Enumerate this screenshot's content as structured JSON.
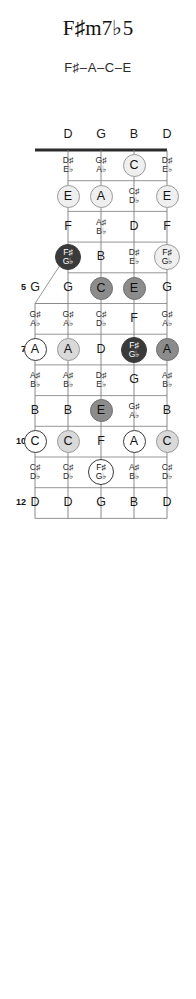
{
  "header": {
    "title": "F♯m7♭5",
    "subtitle": "F♯–A–C–E"
  },
  "instrument": {
    "name": "5-string banjo",
    "string_count": 5,
    "fret_count": 12,
    "open_strings": [
      "D",
      "G",
      "B",
      "D"
    ],
    "fifth_string_open": "G",
    "fifth_string_starts_at_fret": 5
  },
  "chord": {
    "name": "F♯m7♭5",
    "tones": [
      "F♯",
      "A",
      "C",
      "E"
    ],
    "root": "F♯"
  },
  "legend": {
    "root_fill": "#3a3a3a",
    "root_text": "#ffffff",
    "tone_fill_mid": "#8c8c8c",
    "tone_fill_light": "#d9d9d9",
    "tone_fill_pale": "#efefef",
    "tone_fill_open": "#ffffff",
    "line_color": "#8a8a8a",
    "nut_color": "#2b2b2b"
  },
  "fret_markers": [
    "5",
    "7",
    "10",
    "12"
  ],
  "open_row": {
    "fret": 0,
    "labels": [
      "D",
      "G",
      "B",
      "D"
    ]
  },
  "notes": [
    {
      "fret": 1,
      "string": 1,
      "text": "D♯\nE♭",
      "style": "plain"
    },
    {
      "fret": 1,
      "string": 2,
      "text": "G♯\nA♭",
      "style": "plain"
    },
    {
      "fret": 1,
      "string": 3,
      "text": "C",
      "style": "pale"
    },
    {
      "fret": 1,
      "string": 4,
      "text": "D♯\nE♭",
      "style": "plain"
    },
    {
      "fret": 2,
      "string": 1,
      "text": "E",
      "style": "pale"
    },
    {
      "fret": 2,
      "string": 2,
      "text": "A",
      "style": "pale"
    },
    {
      "fret": 2,
      "string": 3,
      "text": "C♯\nD♭",
      "style": "plain"
    },
    {
      "fret": 2,
      "string": 4,
      "text": "E",
      "style": "pale"
    },
    {
      "fret": 3,
      "string": 1,
      "text": "F",
      "style": "plain"
    },
    {
      "fret": 3,
      "string": 2,
      "text": "A♯\nB♭",
      "style": "plain"
    },
    {
      "fret": 3,
      "string": 3,
      "text": "D",
      "style": "plain"
    },
    {
      "fret": 3,
      "string": 4,
      "text": "F",
      "style": "plain"
    },
    {
      "fret": 4,
      "string": 1,
      "text": "F♯\nG♭",
      "style": "root"
    },
    {
      "fret": 4,
      "string": 2,
      "text": "B",
      "style": "plain"
    },
    {
      "fret": 4,
      "string": 3,
      "text": "D♯\nE♭",
      "style": "plain"
    },
    {
      "fret": 4,
      "string": 4,
      "text": "F♯\nG♭",
      "style": "pale"
    },
    {
      "fret": 5,
      "string": 0,
      "text": "G",
      "style": "plain"
    },
    {
      "fret": 5,
      "string": 1,
      "text": "G",
      "style": "plain"
    },
    {
      "fret": 5,
      "string": 2,
      "text": "C",
      "style": "mid"
    },
    {
      "fret": 5,
      "string": 3,
      "text": "E",
      "style": "mid"
    },
    {
      "fret": 5,
      "string": 4,
      "text": "G",
      "style": "plain"
    },
    {
      "fret": 6,
      "string": 0,
      "text": "G♯\nA♭",
      "style": "plain"
    },
    {
      "fret": 6,
      "string": 1,
      "text": "G♯\nA♭",
      "style": "plain"
    },
    {
      "fret": 6,
      "string": 2,
      "text": "C♯\nD♭",
      "style": "plain"
    },
    {
      "fret": 6,
      "string": 3,
      "text": "F",
      "style": "plain"
    },
    {
      "fret": 6,
      "string": 4,
      "text": "G♯\nA♭",
      "style": "plain"
    },
    {
      "fret": 7,
      "string": 0,
      "text": "A",
      "style": "open"
    },
    {
      "fret": 7,
      "string": 1,
      "text": "A",
      "style": "light"
    },
    {
      "fret": 7,
      "string": 2,
      "text": "D",
      "style": "plain"
    },
    {
      "fret": 7,
      "string": 3,
      "text": "F♯\nG♭",
      "style": "root"
    },
    {
      "fret": 7,
      "string": 4,
      "text": "A",
      "style": "mid"
    },
    {
      "fret": 8,
      "string": 0,
      "text": "A♯\nB♭",
      "style": "plain"
    },
    {
      "fret": 8,
      "string": 1,
      "text": "A♯\nB♭",
      "style": "plain"
    },
    {
      "fret": 8,
      "string": 2,
      "text": "D♯\nE♭",
      "style": "plain"
    },
    {
      "fret": 8,
      "string": 3,
      "text": "G",
      "style": "plain"
    },
    {
      "fret": 8,
      "string": 4,
      "text": "A♯\nB♭",
      "style": "plain"
    },
    {
      "fret": 9,
      "string": 0,
      "text": "B",
      "style": "plain"
    },
    {
      "fret": 9,
      "string": 1,
      "text": "B",
      "style": "plain"
    },
    {
      "fret": 9,
      "string": 2,
      "text": "E",
      "style": "mid"
    },
    {
      "fret": 9,
      "string": 3,
      "text": "G♯\nA♭",
      "style": "plain"
    },
    {
      "fret": 9,
      "string": 4,
      "text": "B",
      "style": "plain"
    },
    {
      "fret": 10,
      "string": 0,
      "text": "C",
      "style": "open"
    },
    {
      "fret": 10,
      "string": 1,
      "text": "C",
      "style": "light"
    },
    {
      "fret": 10,
      "string": 2,
      "text": "F",
      "style": "plain"
    },
    {
      "fret": 10,
      "string": 3,
      "text": "A",
      "style": "open"
    },
    {
      "fret": 10,
      "string": 4,
      "text": "C",
      "style": "light"
    },
    {
      "fret": 11,
      "string": 0,
      "text": "C♯\nD♭",
      "style": "plain"
    },
    {
      "fret": 11,
      "string": 1,
      "text": "C♯\nD♭",
      "style": "plain"
    },
    {
      "fret": 11,
      "string": 2,
      "text": "F♯\nG♭",
      "style": "open"
    },
    {
      "fret": 11,
      "string": 3,
      "text": "A♯\nB♭",
      "style": "plain"
    },
    {
      "fret": 11,
      "string": 4,
      "text": "C♯\nD♭",
      "style": "plain"
    },
    {
      "fret": 12,
      "string": 0,
      "text": "D",
      "style": "plain"
    },
    {
      "fret": 12,
      "string": 1,
      "text": "D",
      "style": "plain"
    },
    {
      "fret": 12,
      "string": 2,
      "text": "G",
      "style": "plain"
    },
    {
      "fret": 12,
      "string": 3,
      "text": "B",
      "style": "plain"
    },
    {
      "fret": 12,
      "string": 4,
      "text": "D",
      "style": "plain"
    }
  ]
}
